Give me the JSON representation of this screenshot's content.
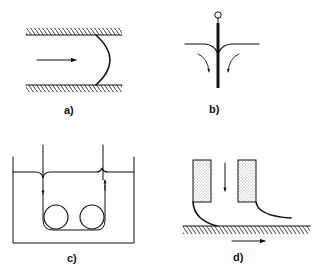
{
  "diagram": {
    "panels": [
      {
        "id": "a",
        "label": "a)",
        "description": "Liquid meniscus advancing in a channel between two hatched walls; arrow shows flow direction"
      },
      {
        "id": "b",
        "label": "b)",
        "description": "Rod/fiber withdrawn through liquid surface with meniscus; curved arrows show downward flow"
      },
      {
        "id": "c",
        "label": "c)",
        "description": "Tape passing down into a bath, around two rollers, and back up through the liquid surface"
      },
      {
        "id": "d",
        "label": "d)",
        "description": "Coating slot die with stippled lips above a moving hatched substrate; downward feed arrow and rightward substrate arrow"
      }
    ],
    "colors": {
      "ink": "#111111",
      "background": "#ffffff"
    }
  }
}
